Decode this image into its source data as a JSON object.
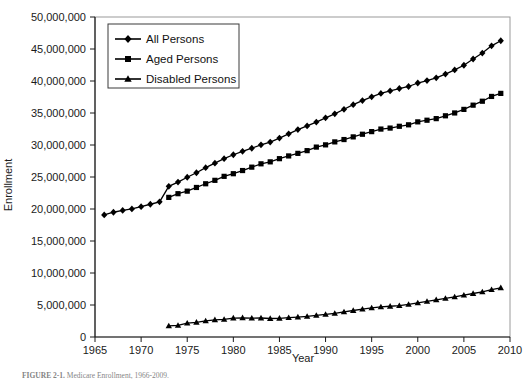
{
  "figure": {
    "caption_prefix": "FIGURE 2-1.",
    "caption_rest": "Medicare Enrollment, 1966-2009."
  },
  "chart_data": {
    "type": "line",
    "title": "",
    "xlabel": "Year",
    "ylabel": "Enrollment",
    "xlim": [
      1965,
      2010
    ],
    "ylim": [
      0,
      50000000
    ],
    "xticks": [
      1965,
      1970,
      1975,
      1980,
      1985,
      1990,
      1995,
      2000,
      2005,
      2010
    ],
    "xticklabels": [
      "1965",
      "1970",
      "1975",
      "1980",
      "1985",
      "1990",
      "1995",
      "2000",
      "2005",
      "2010"
    ],
    "yticks": [
      0,
      5000000,
      10000000,
      15000000,
      20000000,
      25000000,
      30000000,
      35000000,
      40000000,
      45000000,
      50000000
    ],
    "yticklabels": [
      "0",
      "5,000,000",
      "10,000,000",
      "15,000,000",
      "20,000,000",
      "25,000,000",
      "30,000,000",
      "35,000,000",
      "40,000,000",
      "45,000,000",
      "50,000,000"
    ],
    "grid": false,
    "legend_position": "upper-left-inside",
    "series": [
      {
        "name": "All Persons",
        "marker": "diamond",
        "color": "#000000",
        "x": [
          1966,
          1967,
          1968,
          1969,
          1970,
          1971,
          1972,
          1973,
          1974,
          1975,
          1976,
          1977,
          1978,
          1979,
          1980,
          1981,
          1982,
          1983,
          1984,
          1985,
          1986,
          1987,
          1988,
          1989,
          1990,
          1991,
          1992,
          1993,
          1994,
          1995,
          1996,
          1997,
          1998,
          1999,
          2000,
          2001,
          2002,
          2003,
          2004,
          2005,
          2006,
          2007,
          2008,
          2009
        ],
        "values": [
          19082000,
          19494000,
          19771000,
          20014000,
          20361000,
          20742000,
          21115000,
          23545000,
          24201000,
          24959000,
          25663000,
          26458000,
          27164000,
          27859000,
          28478000,
          29010000,
          29494000,
          30026000,
          30455000,
          31083000,
          31750000,
          32411000,
          32981000,
          33579000,
          34251000,
          34870000,
          35579000,
          36306000,
          36935000,
          37535000,
          38064000,
          38445000,
          38825000,
          39140000,
          39688000,
          40059000,
          40489000,
          41078000,
          41734000,
          42459000,
          43436000,
          44368000,
          45498000,
          46287000
        ]
      },
      {
        "name": "Aged Persons",
        "marker": "square",
        "color": "#000000",
        "x": [
          1973,
          1974,
          1975,
          1976,
          1977,
          1978,
          1979,
          1980,
          1981,
          1982,
          1983,
          1984,
          1985,
          1986,
          1987,
          1988,
          1989,
          1990,
          1991,
          1992,
          1993,
          1994,
          1995,
          1996,
          1997,
          1998,
          1999,
          2000,
          2001,
          2002,
          2003,
          2004,
          2005,
          2006,
          2007,
          2008,
          2009
        ],
        "values": [
          21816000,
          22392000,
          22790000,
          23364000,
          23944000,
          24479000,
          25103000,
          25515000,
          26010000,
          26539000,
          27060000,
          27367000,
          27864000,
          28291000,
          28694000,
          29119000,
          29673000,
          30022000,
          30486000,
          30852000,
          31267000,
          31681000,
          32091000,
          32489000,
          32644000,
          32924000,
          33155000,
          33614000,
          33872000,
          34121000,
          34563000,
          35006000,
          35563000,
          36224000,
          36840000,
          37588000,
          38064000
        ]
      },
      {
        "name": "Disabled Persons",
        "marker": "triangle",
        "color": "#000000",
        "x": [
          1973,
          1974,
          1975,
          1976,
          1977,
          1978,
          1979,
          1980,
          1981,
          1982,
          1983,
          1984,
          1985,
          1986,
          1987,
          1988,
          1989,
          1990,
          1991,
          1992,
          1993,
          1994,
          1995,
          1996,
          1997,
          1998,
          1999,
          2000,
          2001,
          2002,
          2003,
          2004,
          2005,
          2006,
          2007,
          2008,
          2009
        ],
        "values": [
          1729000,
          1809000,
          2168000,
          2299000,
          2514000,
          2685000,
          2756000,
          2963000,
          3000000,
          2955000,
          2966000,
          2888000,
          2919000,
          3019000,
          3117000,
          3222000,
          3366000,
          3529000,
          3684000,
          3927000,
          4139000,
          4354000,
          4544000,
          4696000,
          4801000,
          4901000,
          5105000,
          5324000,
          5568000,
          5810000,
          6041000,
          6262000,
          6528000,
          6797000,
          7058000,
          7399000,
          7689000
        ]
      }
    ]
  }
}
